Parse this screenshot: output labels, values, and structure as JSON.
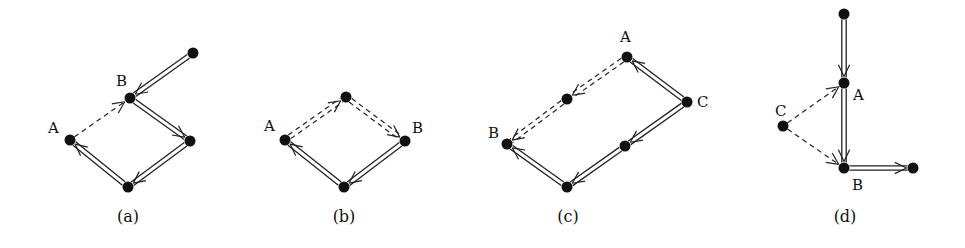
{
  "figure": {
    "background": "#ffffff",
    "ink": "#111111",
    "panels": [
      {
        "id": "a",
        "caption": "(a)",
        "caption_pos": [
          128,
          222
        ],
        "nodes": [
          {
            "id": "a-top",
            "label": "",
            "x": 193,
            "y": 53
          },
          {
            "id": "a-B",
            "label": "B",
            "x": 130,
            "y": 98,
            "label_pos": [
              116,
              86
            ]
          },
          {
            "id": "a-A",
            "label": "A",
            "x": 70,
            "y": 140,
            "label_pos": [
              48,
              133
            ]
          },
          {
            "id": "a-right",
            "label": "",
            "x": 190,
            "y": 141
          },
          {
            "id": "a-bottom",
            "label": "",
            "x": 128,
            "y": 187
          }
        ],
        "edges": [
          {
            "from": "a-top",
            "to": "a-B",
            "style": "double",
            "arrow_at": "to"
          },
          {
            "from": "a-A",
            "to": "a-B",
            "style": "dashed",
            "arrow_at": "to"
          },
          {
            "from": "a-B",
            "to": "a-right",
            "style": "double",
            "arrow_at": "to"
          },
          {
            "from": "a-right",
            "to": "a-bottom",
            "style": "double",
            "arrow_at": "to"
          },
          {
            "from": "a-bottom",
            "to": "a-A",
            "style": "double",
            "arrow_at": "to"
          }
        ]
      },
      {
        "id": "b",
        "caption": "(b)",
        "caption_pos": [
          344,
          222
        ],
        "nodes": [
          {
            "id": "b-top",
            "label": "",
            "x": 346,
            "y": 97
          },
          {
            "id": "b-A",
            "label": "A",
            "x": 285,
            "y": 140,
            "label_pos": [
              264,
              131
            ]
          },
          {
            "id": "b-B",
            "label": "B",
            "x": 405,
            "y": 141,
            "label_pos": [
              412,
              133
            ]
          },
          {
            "id": "b-bottom",
            "label": "",
            "x": 344,
            "y": 187
          }
        ],
        "edges": [
          {
            "from": "b-A",
            "to": "b-top",
            "style": "double-dashed",
            "arrow_at": "to"
          },
          {
            "from": "b-top",
            "to": "b-B",
            "style": "double-dashed",
            "arrow_at": "to"
          },
          {
            "from": "b-B",
            "to": "b-bottom",
            "style": "double",
            "arrow_at": "to"
          },
          {
            "from": "b-bottom",
            "to": "b-A",
            "style": "double",
            "arrow_at": "to"
          }
        ]
      },
      {
        "id": "c",
        "caption": "(c)",
        "caption_pos": [
          568,
          222
        ],
        "nodes": [
          {
            "id": "c-A",
            "label": "A",
            "x": 627,
            "y": 57,
            "label_pos": [
              620,
              42
            ]
          },
          {
            "id": "c-C",
            "label": "C",
            "x": 687,
            "y": 102,
            "label_pos": [
              697,
              107
            ]
          },
          {
            "id": "c-mid-dashed",
            "label": "",
            "x": 567,
            "y": 99
          },
          {
            "id": "c-B",
            "label": "B",
            "x": 507,
            "y": 144,
            "label_pos": [
              488,
              138
            ]
          },
          {
            "id": "c-mid-solid",
            "label": "",
            "x": 625,
            "y": 146
          },
          {
            "id": "c-bottom",
            "label": "",
            "x": 567,
            "y": 187
          }
        ],
        "edges": [
          {
            "from": "c-C",
            "to": "c-A",
            "style": "double",
            "arrow_at": "to"
          },
          {
            "from": "c-A",
            "to": "c-mid-dashed",
            "style": "double-dashed",
            "arrow_at": "to"
          },
          {
            "from": "c-mid-dashed",
            "to": "c-B",
            "style": "double-dashed",
            "arrow_at": "to"
          },
          {
            "from": "c-C",
            "to": "c-mid-solid",
            "style": "double",
            "arrow_at": "to"
          },
          {
            "from": "c-mid-solid",
            "to": "c-bottom",
            "style": "double",
            "arrow_at": "to"
          },
          {
            "from": "c-bottom",
            "to": "c-B",
            "style": "double",
            "arrow_at": "to"
          }
        ]
      },
      {
        "id": "d",
        "caption": "(d)",
        "caption_pos": [
          845,
          222
        ],
        "nodes": [
          {
            "id": "d-top",
            "label": "",
            "x": 844,
            "y": 14
          },
          {
            "id": "d-A",
            "label": "A",
            "x": 844,
            "y": 83,
            "label_pos": [
              853,
              100
            ]
          },
          {
            "id": "d-C",
            "label": "C",
            "x": 783,
            "y": 126,
            "label_pos": [
              775,
              116
            ]
          },
          {
            "id": "d-B",
            "label": "B",
            "x": 844,
            "y": 168,
            "label_pos": [
              852,
              190
            ]
          },
          {
            "id": "d-right",
            "label": "",
            "x": 913,
            "y": 168
          }
        ],
        "edges": [
          {
            "from": "d-top",
            "to": "d-A",
            "style": "double",
            "arrow_at": "to"
          },
          {
            "from": "d-C",
            "to": "d-A",
            "style": "dashed",
            "arrow_at": "to"
          },
          {
            "from": "d-C",
            "to": "d-B",
            "style": "dashed",
            "arrow_at": "to"
          },
          {
            "from": "d-A",
            "to": "d-B",
            "style": "double",
            "arrow_at": "to"
          },
          {
            "from": "d-B",
            "to": "d-right",
            "style": "double",
            "arrow_at": "to"
          }
        ]
      }
    ]
  }
}
